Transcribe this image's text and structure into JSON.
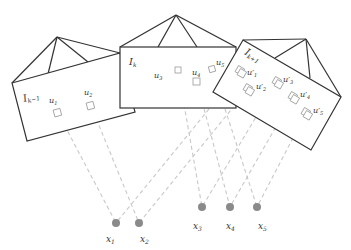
{
  "cameras": [
    {
      "id": "cam-km1",
      "label": "I",
      "sub": "k−1",
      "features": [
        {
          "label": "u",
          "sub": "1"
        },
        {
          "label": "u",
          "sub": "2"
        }
      ]
    },
    {
      "id": "cam-k",
      "label": "I",
      "sub": "k",
      "features": [
        {
          "label": "u",
          "sub": "3"
        },
        {
          "label": "u",
          "sub": "4"
        },
        {
          "label": "u",
          "sub": "5"
        }
      ]
    },
    {
      "id": "cam-kp1",
      "label": "I",
      "sub": "k+1",
      "features": [
        {
          "label": "u′",
          "sub": "1"
        },
        {
          "label": "u′",
          "sub": "2"
        },
        {
          "label": "u′",
          "sub": "3"
        },
        {
          "label": "u′",
          "sub": "4"
        },
        {
          "label": "u′",
          "sub": "5"
        }
      ]
    }
  ],
  "points": [
    {
      "label": "x",
      "sub": "1"
    },
    {
      "label": "x",
      "sub": "2"
    },
    {
      "label": "x",
      "sub": "3"
    },
    {
      "label": "x",
      "sub": "4"
    },
    {
      "label": "x",
      "sub": "5"
    }
  ],
  "colors": {
    "frame": "#333333",
    "ray": "#c8c8c8",
    "point": "#8a8a8a",
    "feature": "#9a9a9a"
  }
}
